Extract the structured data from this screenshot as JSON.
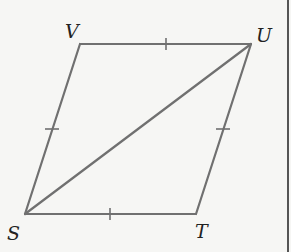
{
  "diagram": {
    "type": "rhombus-with-diagonal",
    "colors": {
      "background": "#f6f6f4",
      "stroke": "#707070",
      "border": "#555555",
      "label": "#222222"
    },
    "vertices": [
      {
        "name": "V",
        "x": 80,
        "y": 44
      },
      {
        "name": "U",
        "x": 251,
        "y": 44
      },
      {
        "name": "T",
        "x": 196,
        "y": 214
      },
      {
        "name": "S",
        "x": 25,
        "y": 214
      }
    ],
    "labels": {
      "V": "V",
      "U": "U",
      "S": "S",
      "T": "T"
    },
    "edges": [
      {
        "from": "V",
        "to": "U",
        "tick": true
      },
      {
        "from": "U",
        "to": "T",
        "tick": true
      },
      {
        "from": "T",
        "to": "S",
        "tick": true
      },
      {
        "from": "S",
        "to": "V",
        "tick": true
      }
    ],
    "diagonal": {
      "from": "S",
      "to": "U"
    }
  }
}
